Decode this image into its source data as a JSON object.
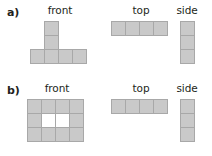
{
  "figure": {
    "caption_parts": [
      "a)",
      "b)"
    ],
    "view_labels": {
      "front": "front",
      "top": "top",
      "side": "side"
    },
    "colors": {
      "cell_fill": "#c9c9c9",
      "cell_border": "#a8a8a8",
      "hollow_fill": "#ffffff",
      "text": "#231f20",
      "background": "#ffffff"
    },
    "cell_size_px": 15
  },
  "parts": [
    {
      "id": "a",
      "label": "a)",
      "views": [
        {
          "id": "a-front",
          "label": "front",
          "type": "front",
          "cols": 4,
          "rows": 3,
          "filled_cells": [
            [
              1,
              0
            ],
            [
              1,
              1
            ],
            [
              0,
              2
            ],
            [
              1,
              2
            ],
            [
              2,
              2
            ],
            [
              3,
              2
            ]
          ],
          "hollow_cells": []
        },
        {
          "id": "a-top",
          "label": "top",
          "type": "top",
          "cols": 4,
          "rows": 1,
          "filled_cells": [
            [
              0,
              0
            ],
            [
              1,
              0
            ],
            [
              2,
              0
            ],
            [
              3,
              0
            ]
          ],
          "hollow_cells": []
        },
        {
          "id": "a-side",
          "label": "side",
          "type": "side",
          "cols": 1,
          "rows": 3,
          "filled_cells": [
            [
              0,
              0
            ],
            [
              0,
              1
            ],
            [
              0,
              2
            ]
          ],
          "hollow_cells": []
        }
      ]
    },
    {
      "id": "b",
      "label": "b)",
      "views": [
        {
          "id": "b-front",
          "label": "front",
          "type": "front",
          "cols": 4,
          "rows": 3,
          "filled_cells": [
            [
              0,
              0
            ],
            [
              1,
              0
            ],
            [
              2,
              0
            ],
            [
              3,
              0
            ],
            [
              0,
              1
            ],
            [
              3,
              1
            ],
            [
              0,
              2
            ],
            [
              1,
              2
            ],
            [
              2,
              2
            ],
            [
              3,
              2
            ]
          ],
          "hollow_cells": [
            [
              1,
              1
            ],
            [
              2,
              1
            ]
          ]
        },
        {
          "id": "b-top",
          "label": "top",
          "type": "top",
          "cols": 4,
          "rows": 1,
          "filled_cells": [
            [
              0,
              0
            ],
            [
              1,
              0
            ],
            [
              2,
              0
            ],
            [
              3,
              0
            ]
          ],
          "hollow_cells": []
        },
        {
          "id": "b-side",
          "label": "side",
          "type": "side",
          "cols": 1,
          "rows": 3,
          "filled_cells": [
            [
              0,
              0
            ],
            [
              0,
              1
            ],
            [
              0,
              2
            ]
          ],
          "hollow_cells": []
        }
      ]
    }
  ]
}
